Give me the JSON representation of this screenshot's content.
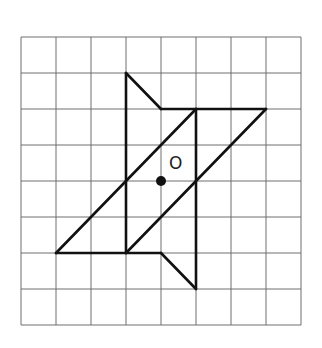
{
  "figure": {
    "grid": {
      "columns": 8,
      "rows": 8,
      "origin_px": [
        21,
        37
      ],
      "cell_w_px": 35,
      "cell_h_px": 36,
      "line_color": "#6e6e6e"
    },
    "segments": [
      {
        "from": [
          3,
          1
        ],
        "to": [
          3,
          6
        ]
      },
      {
        "from": [
          3,
          1
        ],
        "to": [
          4,
          2
        ]
      },
      {
        "from": [
          4,
          2
        ],
        "to": [
          7,
          2
        ]
      },
      {
        "from": [
          5,
          2
        ],
        "to": [
          5,
          7
        ]
      },
      {
        "from": [
          5,
          2
        ],
        "to": [
          1,
          6
        ]
      },
      {
        "from": [
          1,
          6
        ],
        "to": [
          4,
          6
        ]
      },
      {
        "from": [
          4,
          6
        ],
        "to": [
          5,
          7
        ]
      },
      {
        "from": [
          7,
          2
        ],
        "to": [
          3,
          6
        ]
      }
    ],
    "center_point": {
      "label": "O",
      "grid_pos": [
        4,
        4
      ]
    },
    "stroke_color": "#111111"
  }
}
